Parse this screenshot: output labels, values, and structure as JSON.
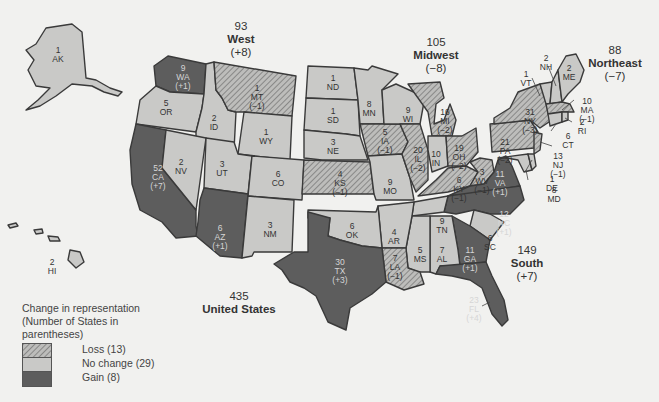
{
  "regions": {
    "west": {
      "seats": "93",
      "name": "West",
      "change": "(+8)"
    },
    "midwest": {
      "seats": "105",
      "name": "Midwest",
      "change": "(−8)"
    },
    "northeast": {
      "seats": "88",
      "name": "Northeast",
      "change": "(−7)"
    },
    "south": {
      "seats": "149",
      "name": "South",
      "change": "(+7)"
    },
    "us": {
      "seats": "435",
      "name": "United States"
    }
  },
  "legend": {
    "title": "Change in representation (Number of States in parentheses)",
    "title_lines": [
      "Change in representation",
      "(Number of States in",
      "parentheses)"
    ],
    "items": [
      {
        "label": "Loss (13)",
        "category": "loss"
      },
      {
        "label": "No change (29)",
        "category": "nochange"
      },
      {
        "label": "Gain (8)",
        "category": "gain"
      }
    ]
  },
  "colors": {
    "loss_hatch": "#8a8a8a",
    "nochange": "#c9c9c7",
    "gain": "#5d5d5d",
    "background": "#f1f1ef",
    "border": "#3a3a3a"
  },
  "states": {
    "AK": {
      "seats": "1",
      "abbr": "AK",
      "change": "",
      "category": "nochange"
    },
    "HI": {
      "seats": "2",
      "abbr": "HI",
      "change": "",
      "category": "nochange"
    },
    "WA": {
      "seats": "9",
      "abbr": "WA",
      "change": "(+1)",
      "category": "gain"
    },
    "OR": {
      "seats": "5",
      "abbr": "OR",
      "change": "",
      "category": "nochange"
    },
    "CA": {
      "seats": "52",
      "abbr": "CA",
      "change": "(+7)",
      "category": "gain"
    },
    "ID": {
      "seats": "2",
      "abbr": "ID",
      "change": "",
      "category": "nochange"
    },
    "NV": {
      "seats": "2",
      "abbr": "NV",
      "change": "",
      "category": "nochange"
    },
    "MT": {
      "seats": "1",
      "abbr": "MT",
      "change": "(−1)",
      "category": "loss"
    },
    "WY": {
      "seats": "1",
      "abbr": "WY",
      "change": "",
      "category": "nochange"
    },
    "UT": {
      "seats": "3",
      "abbr": "UT",
      "change": "",
      "category": "nochange"
    },
    "CO": {
      "seats": "6",
      "abbr": "CO",
      "change": "",
      "category": "nochange"
    },
    "AZ": {
      "seats": "6",
      "abbr": "AZ",
      "change": "(+1)",
      "category": "gain"
    },
    "NM": {
      "seats": "3",
      "abbr": "NM",
      "change": "",
      "category": "nochange"
    },
    "ND": {
      "seats": "1",
      "abbr": "ND",
      "change": "",
      "category": "nochange"
    },
    "SD": {
      "seats": "1",
      "abbr": "SD",
      "change": "",
      "category": "nochange"
    },
    "NE": {
      "seats": "3",
      "abbr": "NE",
      "change": "",
      "category": "nochange"
    },
    "KS": {
      "seats": "4",
      "abbr": "KS",
      "change": "(−1)",
      "category": "loss"
    },
    "MN": {
      "seats": "8",
      "abbr": "MN",
      "change": "",
      "category": "nochange"
    },
    "IA": {
      "seats": "5",
      "abbr": "IA",
      "change": "(−1)",
      "category": "loss"
    },
    "MO": {
      "seats": "9",
      "abbr": "MO",
      "change": "",
      "category": "nochange"
    },
    "WI": {
      "seats": "9",
      "abbr": "WI",
      "change": "",
      "category": "nochange"
    },
    "IL": {
      "seats": "20",
      "abbr": "IL",
      "change": "(−2)",
      "category": "loss"
    },
    "MI": {
      "seats": "16",
      "abbr": "MI",
      "change": "(−2)",
      "category": "loss"
    },
    "IN": {
      "seats": "10",
      "abbr": "IN",
      "change": "",
      "category": "nochange"
    },
    "OH": {
      "seats": "19",
      "abbr": "OH",
      "change": "(−2)",
      "category": "loss"
    },
    "OK": {
      "seats": "6",
      "abbr": "OK",
      "change": "",
      "category": "nochange"
    },
    "TX": {
      "seats": "30",
      "abbr": "TX",
      "change": "(+3)",
      "category": "gain"
    },
    "AR": {
      "seats": "4",
      "abbr": "AR",
      "change": "",
      "category": "nochange"
    },
    "LA": {
      "seats": "7",
      "abbr": "LA",
      "change": "(−1)",
      "category": "loss"
    },
    "MS": {
      "seats": "5",
      "abbr": "MS",
      "change": "",
      "category": "nochange"
    },
    "AL": {
      "seats": "7",
      "abbr": "AL",
      "change": "",
      "category": "nochange"
    },
    "TN": {
      "seats": "9",
      "abbr": "TN",
      "change": "",
      "category": "nochange"
    },
    "KY": {
      "seats": "6",
      "abbr": "KY",
      "change": "(−1)",
      "category": "loss"
    },
    "WV": {
      "seats": "3",
      "abbr": "WV",
      "change": "(−1)",
      "category": "loss"
    },
    "VA": {
      "seats": "11",
      "abbr": "VA",
      "change": "(+1)",
      "category": "gain"
    },
    "NC": {
      "seats": "12",
      "abbr": "NC",
      "change": "(+1)",
      "category": "gain"
    },
    "SC": {
      "seats": "6",
      "abbr": "SC",
      "change": "",
      "category": "nochange"
    },
    "GA": {
      "seats": "11",
      "abbr": "GA",
      "change": "(+1)",
      "category": "gain"
    },
    "FL": {
      "seats": "23",
      "abbr": "FL",
      "change": "(+4)",
      "category": "gain"
    },
    "PA": {
      "seats": "21",
      "abbr": "PA",
      "change": "(−2)",
      "category": "loss"
    },
    "NY": {
      "seats": "31",
      "abbr": "NY",
      "change": "(−3)",
      "category": "loss"
    },
    "NJ": {
      "seats": "13",
      "abbr": "NJ",
      "change": "(−1)",
      "category": "loss"
    },
    "DE": {
      "seats": "1",
      "abbr": "DE",
      "change": "",
      "category": "nochange"
    },
    "MD": {
      "seats": "8",
      "abbr": "MD",
      "change": "",
      "category": "nochange"
    },
    "VT": {
      "seats": "1",
      "abbr": "VT",
      "change": "",
      "category": "nochange"
    },
    "NH": {
      "seats": "2",
      "abbr": "NH",
      "change": "",
      "category": "nochange"
    },
    "ME": {
      "seats": "2",
      "abbr": "ME",
      "change": "",
      "category": "nochange"
    },
    "MA": {
      "seats": "10",
      "abbr": "MA",
      "change": "(−1)",
      "category": "loss"
    },
    "RI": {
      "seats": "2",
      "abbr": "RI",
      "change": "",
      "category": "nochange"
    },
    "CT": {
      "seats": "6",
      "abbr": "CT",
      "change": "",
      "category": "nochange"
    }
  }
}
